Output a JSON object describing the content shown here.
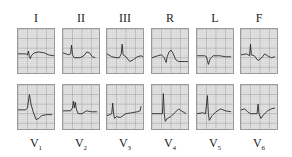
{
  "limb_leads": [
    {
      "label": "I",
      "x": 17,
      "trace": "M0,26 L8,26 L10,27 L11,23 L12,29 L13,31 L14,28 L17,25 L22,24 L28,25 L32,27 L38,28"
    },
    {
      "label": "II",
      "x": 62,
      "trace": "M0,25 L6,27 L8,26 L9,17 L10,27 L12,30 L18,30 L22,28 L25,24 L28,25 L31,29 L34,30"
    },
    {
      "label": "III",
      "x": 106,
      "trace": "M0,26 L5,29 L10,30 L13,30 L15,26 L16,16 L17,27 L20,29 L24,34 L28,32 L32,29 L36,28 L38,29"
    },
    {
      "label": "R",
      "x": 151,
      "trace": "M0,30 L6,28 L10,27 L13,30 L14,33 L15,35 L16,29 L18,24 L20,22 L22,25 L25,32 L28,34 L34,34 L38,34"
    },
    {
      "label": "L",
      "x": 196,
      "trace": "M0,28 L8,28 L10,29 L11,33 L12,37 L14,31 L17,28 L24,28 L30,29 L36,29"
    },
    {
      "label": "F",
      "x": 240,
      "trace": "M0,27 L6,26 L9,28 L10,16 L11,27 L14,28 L18,33 L22,30 L25,26 L28,28 L32,30 L36,29"
    }
  ],
  "chest_leads": [
    {
      "label": "V",
      "sub": "1",
      "x": 17,
      "trace": "M0,26 L8,26 L10,24 L12,10 L14,21 L16,28 L19,36 L22,35 L25,32 L30,31 L36,31"
    },
    {
      "label": "V",
      "sub": "2",
      "x": 62,
      "trace": "M0,27 L8,27 L10,24 L11,17 L12,24 L13,18 L14,25 L16,30 L20,30 L25,27 L30,28 L36,28"
    },
    {
      "label": "V",
      "sub": "3",
      "x": 106,
      "trace": "M0,32 L3,31 L5,30 L6,19 L7,30 L8,35 L10,33 L14,34 L20,30 L26,29 L32,28 L35,27 L36,22"
    },
    {
      "label": "V",
      "sub": "4",
      "x": 151,
      "trace": "M0,30 L9,30 L11,30 L12,9 L13,30 L14,38 L16,35 L20,33 L24,29 L28,25 L31,27 L36,30"
    },
    {
      "label": "V",
      "sub": "5",
      "x": 196,
      "trace": "M0,30 L6,29 L9,30 L11,11 L12,30 L13,37 L16,32 L20,28 L25,25 L30,27 L36,28"
    },
    {
      "label": "V",
      "sub": "6",
      "x": 240,
      "trace": "M0,26 L4,25 L7,28 L10,30 L17,30 L18,20 L19,30 L21,35 L24,31 L28,27 L32,25 L36,24"
    }
  ],
  "colors": {
    "grid_bg": "#e9e9e9",
    "grid_fine": "#b8b8b8",
    "grid_major": "#8a8a8a",
    "trace": "#222222"
  }
}
